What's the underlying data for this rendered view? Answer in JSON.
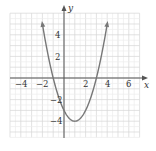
{
  "chart_data": {
    "type": "line",
    "title": "",
    "xlabel": "x",
    "ylabel": "y",
    "function": "y = x^2 - 2x - 3",
    "xlim": [
      -5,
      7
    ],
    "ylim": [
      -5.6,
      6.1
    ],
    "grid": true,
    "legend": null,
    "x_tick_labels": [
      "-4",
      "-2",
      "2",
      "4",
      "6"
    ],
    "x_ticks": [
      -4,
      -2,
      2,
      4,
      6
    ],
    "y_tick_labels": [
      "4",
      "2",
      "-2",
      "-4"
    ],
    "y_ticks": [
      4,
      2,
      -2,
      -4
    ],
    "series": [
      {
        "name": "parabola",
        "x": [
          -2,
          -1.5,
          -1,
          -0.5,
          0,
          0.5,
          1,
          1.5,
          2,
          2.5,
          3,
          3.5,
          4
        ],
        "y": [
          5,
          2.25,
          0,
          -1.75,
          -3,
          -3.75,
          -4,
          -3.75,
          -3,
          -1.75,
          0,
          2.25,
          5
        ]
      }
    ],
    "annotations": {
      "vertex": [
        1,
        -4
      ],
      "x_intercepts": [
        -1,
        3
      ],
      "y_intercept": -3,
      "arrows_on_ends": true
    }
  },
  "labels": {
    "x_axis": "x",
    "y_axis": "y",
    "ticks": {
      "xm4": "−4",
      "xm2": "−2",
      "x2": "2",
      "x4": "4",
      "x6": "6",
      "y4": "4",
      "y2": "2",
      "ym2": "−2",
      "ym4": "−4"
    }
  }
}
